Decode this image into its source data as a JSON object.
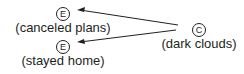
{
  "diagram": {
    "type": "cause-effect",
    "cause": {
      "symbol": "C",
      "label": "(dark clouds)"
    },
    "effects": [
      {
        "symbol": "E",
        "label": "(canceled plans)"
      },
      {
        "symbol": "E",
        "label": "(stayed home)"
      }
    ],
    "colors": {
      "ink": "#231f20",
      "background": "#ffffff"
    }
  }
}
